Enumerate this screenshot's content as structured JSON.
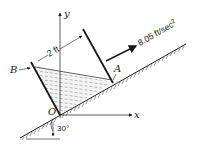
{
  "diagram": {
    "labels": {
      "y_axis": "y",
      "x_axis": "x",
      "origin": "O",
      "point_a": "A",
      "point_b": "B",
      "width": "2 ft",
      "acceleration": "8.05 ft/sec",
      "acceleration_exp": "2",
      "angle": "30°"
    },
    "colors": {
      "ink": "#1a1a1a",
      "hatch": "#555555",
      "fluid_dash": "#777777",
      "background": "#ffffff"
    }
  }
}
